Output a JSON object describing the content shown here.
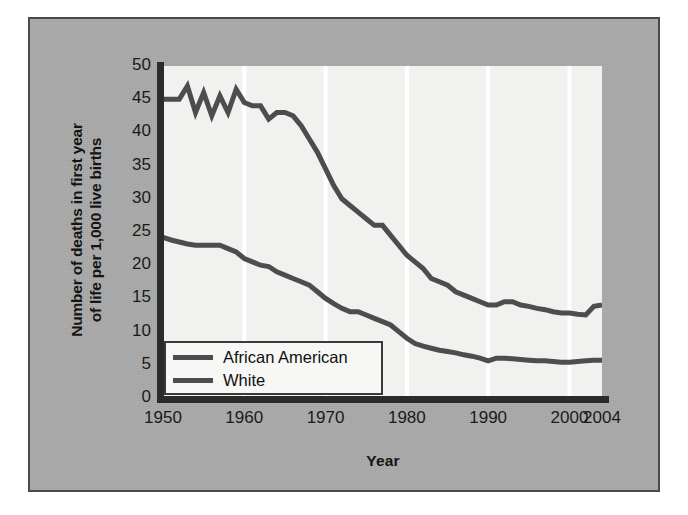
{
  "figure": {
    "panel_color": "#a9a9a9",
    "plot_background": "#f1f1ef",
    "border_color": "#4a4a4a",
    "line_color": "#4d4d4d",
    "gridline_color": "#ffffff"
  },
  "chart_data": {
    "type": "line",
    "title": "",
    "xlabel": "Year",
    "ylabel": "Number of deaths in first year of life per 1,000 live births",
    "ylabel_line1": "Number of deaths in first year",
    "ylabel_line2": "of life per 1,000 live births",
    "xlim": [
      1950,
      2004
    ],
    "ylim": [
      0,
      50
    ],
    "xticks": [
      1950,
      1960,
      1970,
      1980,
      1990,
      2000,
      2004
    ],
    "xtick_labels": [
      "1950",
      "1960",
      "1970",
      "1980",
      "1990",
      "2000",
      "2004"
    ],
    "yticks": [
      0,
      5,
      10,
      15,
      20,
      25,
      30,
      35,
      40,
      45,
      50
    ],
    "ytick_labels": [
      "0",
      "5",
      "10",
      "15",
      "20",
      "25",
      "30",
      "35",
      "40",
      "45",
      "50"
    ],
    "grid": "vertical-only",
    "gridlines_x": [
      1960,
      1970,
      1980,
      1990,
      2000
    ],
    "legend_position": "lower-left-inside",
    "series": [
      {
        "name": "African American",
        "color": "#4d4d4d",
        "x": [
          1950,
          1951,
          1952,
          1953,
          1954,
          1955,
          1956,
          1957,
          1958,
          1959,
          1960,
          1961,
          1962,
          1963,
          1964,
          1965,
          1966,
          1967,
          1968,
          1969,
          1970,
          1971,
          1972,
          1973,
          1974,
          1975,
          1976,
          1977,
          1978,
          1979,
          1980,
          1981,
          1982,
          1983,
          1984,
          1985,
          1986,
          1987,
          1988,
          1989,
          1990,
          1991,
          1992,
          1993,
          1994,
          1995,
          1996,
          1997,
          1998,
          1999,
          2000,
          2001,
          2002,
          2003,
          2004
        ],
        "values": [
          45.0,
          45.0,
          45.0,
          47.0,
          43.0,
          46.0,
          42.5,
          45.5,
          43.0,
          46.5,
          44.5,
          44.0,
          44.0,
          42.0,
          43.0,
          43.0,
          42.5,
          41.0,
          39.0,
          37.0,
          34.5,
          32.0,
          30.0,
          29.0,
          28.0,
          27.0,
          26.0,
          26.0,
          24.5,
          23.0,
          21.5,
          20.5,
          19.5,
          18.0,
          17.5,
          17.0,
          16.0,
          15.5,
          15.0,
          14.5,
          14.0,
          14.0,
          14.5,
          14.5,
          14.0,
          13.8,
          13.5,
          13.3,
          13.0,
          12.8,
          12.8,
          12.6,
          12.5,
          13.8,
          14.0
        ]
      },
      {
        "name": "White",
        "color": "#4d4d4d",
        "x": [
          1950,
          1951,
          1952,
          1953,
          1954,
          1955,
          1956,
          1957,
          1958,
          1959,
          1960,
          1961,
          1962,
          1963,
          1964,
          1965,
          1966,
          1967,
          1968,
          1969,
          1970,
          1971,
          1972,
          1973,
          1974,
          1975,
          1976,
          1977,
          1978,
          1979,
          1980,
          1981,
          1982,
          1983,
          1984,
          1985,
          1986,
          1987,
          1988,
          1989,
          1990,
          1991,
          1992,
          1993,
          1994,
          1995,
          1996,
          1997,
          1998,
          1999,
          2000,
          2001,
          2002,
          2003,
          2004
        ],
        "values": [
          24.2,
          23.8,
          23.5,
          23.2,
          23.0,
          23.0,
          23.0,
          23.0,
          22.5,
          22.0,
          21.0,
          20.5,
          20.0,
          19.8,
          19.0,
          18.5,
          18.0,
          17.5,
          17.0,
          16.0,
          15.0,
          14.2,
          13.5,
          13.0,
          13.0,
          12.5,
          12.0,
          11.5,
          11.0,
          10.0,
          9.0,
          8.2,
          7.8,
          7.5,
          7.2,
          7.0,
          6.8,
          6.5,
          6.3,
          6.0,
          5.6,
          6.0,
          6.0,
          5.9,
          5.8,
          5.7,
          5.6,
          5.6,
          5.5,
          5.4,
          5.4,
          5.5,
          5.6,
          5.7,
          5.7
        ]
      }
    ]
  },
  "legend": {
    "entries": [
      {
        "label": "African American"
      },
      {
        "label": "White"
      }
    ]
  }
}
